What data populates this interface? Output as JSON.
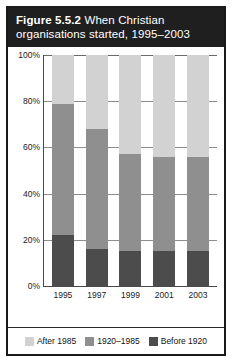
{
  "figure": {
    "label": "Figure 5.5.2",
    "caption": "When Christian organisations started, 1995–2003"
  },
  "colors": {
    "after_1985": "#d2d2d2",
    "period_1920_1985": "#8f8f8f",
    "before_1920": "#4c4c4c",
    "frame": "#1a1a1a",
    "caption_background": "#1f1f1f",
    "caption_text": "#ffffff"
  },
  "axis": {
    "y_ticks": [
      "100%",
      "80%",
      "60%",
      "40%",
      "20%",
      "0%"
    ],
    "x_ticks": [
      "1995",
      "1997",
      "1999",
      "2001",
      "2003"
    ]
  },
  "legend": {
    "items": [
      {
        "label": "After 1985",
        "swatch": "after_1985"
      },
      {
        "label": "1920–1985",
        "swatch": "period_1920_1985"
      },
      {
        "label": "Before 1920",
        "swatch": "before_1920"
      }
    ]
  },
  "chart_data": {
    "type": "bar",
    "stacked": true,
    "percent": true,
    "title": "Figure 5.5.2 When Christian organisations started, 1995–2003",
    "xlabel": "",
    "ylabel": "",
    "ylim": [
      0,
      100
    ],
    "ytick_values": [
      0,
      20,
      40,
      60,
      80,
      100
    ],
    "grid": true,
    "legend_position": "bottom",
    "categories": [
      "1995",
      "1997",
      "1999",
      "2001",
      "2003"
    ],
    "series": [
      {
        "name": "Before 1920",
        "values": [
          22,
          16,
          15,
          15,
          15
        ]
      },
      {
        "name": "1920–1985",
        "values": [
          57,
          52,
          42,
          41,
          41
        ]
      },
      {
        "name": "After 1985",
        "values": [
          21,
          32,
          43,
          44,
          44
        ]
      }
    ],
    "cumulative_tops": {
      "before_1920": [
        22,
        16,
        15,
        15,
        15
      ],
      "through_1985": [
        79,
        68,
        57,
        56,
        56
      ]
    }
  }
}
